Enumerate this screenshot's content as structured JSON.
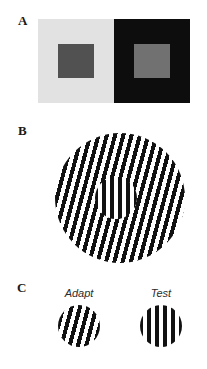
{
  "figure": {
    "background": "#ffffff",
    "width": 207,
    "height": 369
  },
  "panels": {
    "a": {
      "letter": "A",
      "name": "simultaneous-brightness-contrast",
      "left_field": {
        "background_color": "#e2e2e2",
        "patch_color": "#515151"
      },
      "right_field": {
        "background_color": "#0d0d0d",
        "patch_color": "#717171"
      }
    },
    "b": {
      "letter": "B",
      "name": "tilt-illusion-center-surround-grating",
      "surround": {
        "orientation_deg": 15,
        "stripe_period_px": 8,
        "bar_color": "#111111",
        "gap_color": "#ffffff",
        "diameter_px": 130
      },
      "center": {
        "orientation_deg": 0,
        "stripe_period_px": 8,
        "bar_color": "#111111",
        "gap_color": "#ffffff",
        "diameter_px": 42
      }
    },
    "c": {
      "letter": "C",
      "name": "adaptation-paradigm",
      "items": [
        {
          "label": "Adapt",
          "orientation_deg": 15,
          "stripe_period_px": 8,
          "bar_color": "#111111",
          "gap_color": "#ffffff",
          "diameter_px": 42
        },
        {
          "label": "Test",
          "orientation_deg": 0,
          "stripe_period_px": 8,
          "bar_color": "#111111",
          "gap_color": "#ffffff",
          "diameter_px": 42
        }
      ]
    }
  }
}
